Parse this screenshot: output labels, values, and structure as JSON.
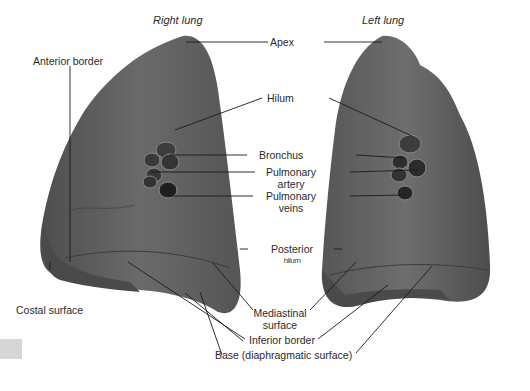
{
  "figure": {
    "titles": {
      "right_lung": "Right lung",
      "left_lung": "Left lung"
    },
    "labels": {
      "apex": "Apex",
      "anterior_border": "Anterior border",
      "hilum": "Hilum",
      "bronchus": "Bronchus",
      "pulmonary_artery_1": "Pulmonary",
      "pulmonary_artery_2": "artery",
      "pulmonary_veins_1": "Pulmonary",
      "pulmonary_veins_2": "veins",
      "posterior_1": "Posterior",
      "posterior_2": "hilum",
      "costal_surface": "Costal surface",
      "mediastinal_surface_1": "Mediastinal",
      "mediastinal_surface_2": "surface",
      "inferior_border": "Inferior border",
      "base": "Base (diaphragmatic surface)"
    },
    "colors": {
      "lung_fill": "#5f5f5f",
      "lung_dark": "#3f3f3f",
      "leader_line": "#1a1a1a",
      "background": "#ffffff"
    }
  }
}
